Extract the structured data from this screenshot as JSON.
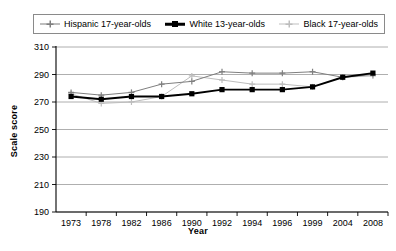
{
  "legend": {
    "items": [
      {
        "label": "Hispanic 17-year-olds",
        "marker": "plus-marker-icon",
        "color": "#7f7f7f"
      },
      {
        "label": "White 13-year-olds",
        "marker": "square-marker-icon",
        "color": "#000000"
      },
      {
        "label": "Black 17-year-olds",
        "marker": "plus-marker-icon",
        "color": "#bdbdbd"
      }
    ]
  },
  "axes": {
    "ylabel": "Scale score",
    "xlabel": "Year",
    "yticks": [
      "310",
      "290",
      "270",
      "250",
      "230",
      "210",
      "190"
    ],
    "xticks": [
      "1973",
      "1978",
      "1982",
      "1986",
      "1990",
      "1992",
      "1994",
      "1996",
      "1999",
      "2004",
      "2008"
    ]
  },
  "chart_data": {
    "type": "line",
    "title": "",
    "xlabel": "Year",
    "ylabel": "Scale score",
    "ylim": [
      190,
      310
    ],
    "ytick_step": 20,
    "grid": true,
    "legend_position": "top",
    "categories": [
      "1973",
      "1978",
      "1982",
      "1986",
      "1990",
      "1992",
      "1994",
      "1996",
      "1999",
      "2004",
      "2008"
    ],
    "series": [
      {
        "name": "Hispanic 17-year-olds",
        "color": "#7f7f7f",
        "marker": "plus",
        "values": [
          277,
          275,
          277,
          283,
          285,
          292,
          291,
          291,
          292,
          288,
          290
        ]
      },
      {
        "name": "White 13-year-olds",
        "color": "#000000",
        "marker": "square",
        "values": [
          274,
          272,
          274,
          274,
          276,
          279,
          279,
          279,
          281,
          288,
          291
        ]
      },
      {
        "name": "Black 17-year-olds",
        "color": "#bdbdbd",
        "marker": "plus",
        "values": [
          276,
          269,
          270,
          274,
          289,
          286,
          283,
          283,
          281,
          288,
          289
        ]
      }
    ]
  }
}
